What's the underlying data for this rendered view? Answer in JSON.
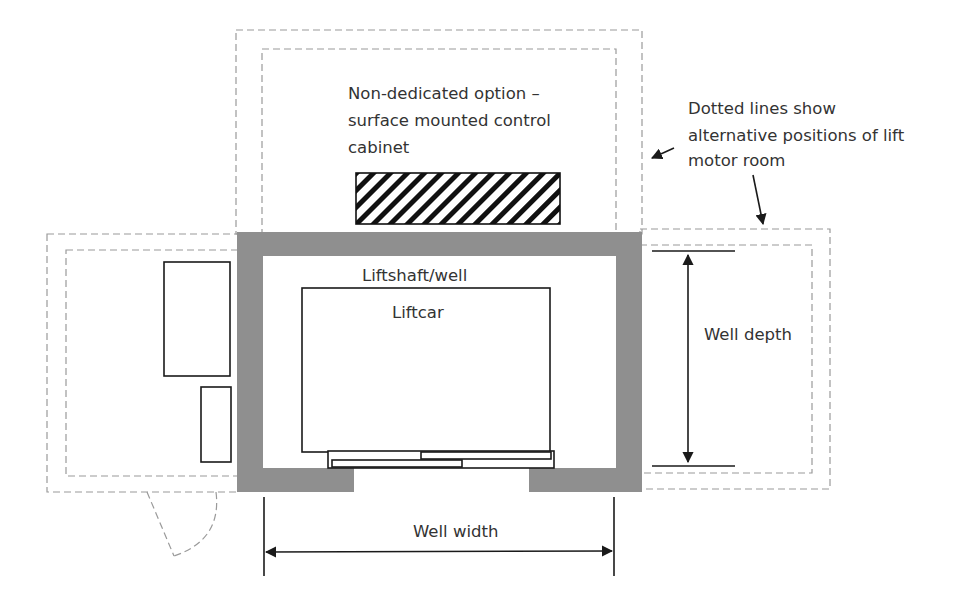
{
  "diagram": {
    "colors": {
      "wall": "#8f8f8f",
      "line": "#1a1a1a",
      "dashed": "#9a9a9a",
      "text": "#333333"
    },
    "labels": {
      "non_dedicated": [
        "Non-dedicated option –",
        "surface mounted control",
        "cabinet"
      ],
      "dotted_note": [
        "Dotted lines show",
        "alternative positions of lift",
        "motor room"
      ],
      "liftshaft": "Liftshaft/well",
      "liftcar": "Liftcar",
      "well_depth": "Well depth",
      "well_width": "Well width"
    },
    "elements": {
      "control_cabinet": "hatched",
      "motor_room_positions": [
        "top",
        "left",
        "right"
      ],
      "door": "swing-door"
    }
  }
}
